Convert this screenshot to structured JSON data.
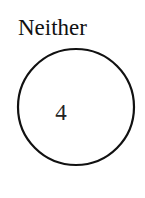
{
  "set": {
    "label": "Neither",
    "count": "4"
  },
  "colors": {
    "stroke": "#111111",
    "text": "#111111"
  }
}
